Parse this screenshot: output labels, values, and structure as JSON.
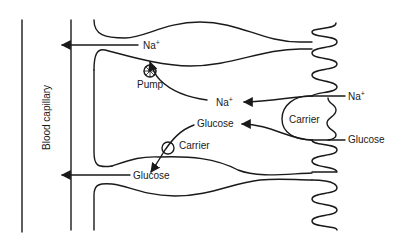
{
  "diagram": {
    "type": "biology-transport-schematic",
    "labels": {
      "capillary": "Blood capillary",
      "na_top": "Na",
      "na_top_sup": "+",
      "pump": "Pump",
      "na_mid": "Na",
      "na_mid_sup": "+",
      "glucose_mid": "Glucose",
      "carrier_basal": "Carrier",
      "glucose_bottom": "Glucose",
      "carrier_apical": "Carrier",
      "na_apical": "Na",
      "na_apical_sup": "+",
      "glucose_apical": "Glucose"
    },
    "flows": [
      {
        "from": "lumen",
        "to": "cell",
        "substance": "Na+",
        "via": "Carrier (apical)"
      },
      {
        "from": "lumen",
        "to": "cell",
        "substance": "Glucose",
        "via": "Carrier (apical)"
      },
      {
        "from": "cell",
        "to": "blood capillary",
        "substance": "Na+",
        "via": "Pump"
      },
      {
        "from": "cell",
        "to": "blood capillary",
        "substance": "Glucose",
        "via": "Carrier (basal)"
      }
    ],
    "colors": {
      "stroke": "#1a1a1a",
      "background": "#ffffff"
    }
  }
}
